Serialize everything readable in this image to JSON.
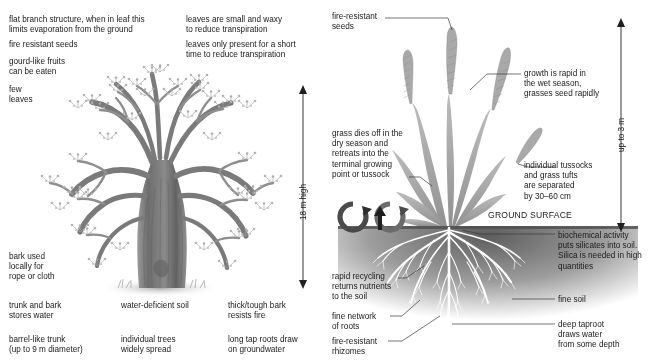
{
  "diagram": {
    "ground_surface_label": "GROUND SURFACE"
  },
  "colors": {
    "ink": "#1a1a1a",
    "leader": "#3a3a3a",
    "tree_dark": "#6f6f6f",
    "tree_mid": "#8d8d8d",
    "tree_light": "#b4b4b4",
    "soil_dark": "#5a5a5a",
    "soil_light": "#d8d8d8",
    "root_white": "#ffffff",
    "arrow_dark": "#3d3d3d"
  },
  "left_panel": {
    "name": "baobab-tree-panel",
    "labels": [
      {
        "id": "flat-branch-structure",
        "text": "flat branch structure, when in leaf this\nlimits evaporation from the ground",
        "x": 9,
        "y": 15
      },
      {
        "id": "fire-resistant-seeds-tree",
        "text": "fire resistant seeds",
        "x": 9,
        "y": 40
      },
      {
        "id": "gourd-like-fruits",
        "text": "gourd-like fruits\ncan be eaten",
        "x": 9,
        "y": 57
      },
      {
        "id": "few-leaves",
        "text": "few\nleaves",
        "x": 9,
        "y": 85
      },
      {
        "id": "leaves-small-waxy",
        "text": "leaves are small and waxy\nto reduce transpiration",
        "x": 186,
        "y": 15
      },
      {
        "id": "leaves-short-time",
        "text": "leaves only present for a short\ntime to reduce transpiration",
        "x": 186,
        "y": 40
      },
      {
        "id": "bark-used-locally",
        "text": "bark used\nlocally for\nrope or cloth",
        "x": 9,
        "y": 252
      },
      {
        "id": "trunk-bark-stores-water",
        "text": "trunk and bark\nstores water",
        "x": 9,
        "y": 301
      },
      {
        "id": "water-deficient-soil",
        "text": "water-deficient soil",
        "x": 121,
        "y": 301
      },
      {
        "id": "thick-tough-bark",
        "text": "thick/tough bark\nresists fire",
        "x": 228,
        "y": 301
      },
      {
        "id": "barrel-like-trunk",
        "text": "barrel-like trunk\n(up to 9 m diameter)",
        "x": 9,
        "y": 335
      },
      {
        "id": "individual-trees-spread",
        "text": "individual trees\nwidely spread",
        "x": 121,
        "y": 335
      },
      {
        "id": "long-tap-roots",
        "text": "long tap roots draw\non groundwater",
        "x": 228,
        "y": 335
      }
    ],
    "height_measure": {
      "id": "tree-height-measure",
      "text": "18 m high",
      "value": 18,
      "unit": "m",
      "x": 299,
      "y_top": 86,
      "y_bottom": 288
    }
  },
  "right_panel": {
    "name": "tussock-grass-panel",
    "labels": [
      {
        "id": "fire-resistant-seeds-grass",
        "text": "fire-resistant\nseeds",
        "x": 332,
        "y": 12
      },
      {
        "id": "growth-rapid-wet-season",
        "text": "growth is rapid in\nthe wet season,\ngrasses seed rapidly",
        "x": 524,
        "y": 69
      },
      {
        "id": "grass-dies-off-dry-season",
        "text": "grass dies off in the\ndry season and\nretreats into the\nterminal growing\npoint or tussock",
        "x": 332,
        "y": 129
      },
      {
        "id": "individual-tussocks",
        "text": "individual tussocks\nand grass tufts\nare separated\nby 30–60 cm",
        "x": 524,
        "y": 161
      },
      {
        "id": "ground-surface",
        "text": "GROUND SURFACE",
        "x": 488,
        "y": 210
      },
      {
        "id": "biochemical-activity",
        "text": "biochemical activity\nputs silicates into soil.\nSilica is needed in high\nquantities",
        "x": 558,
        "y": 231
      },
      {
        "id": "rapid-recycling",
        "text": "rapid recycling\nreturns nutrients\nto the soil",
        "x": 332,
        "y": 272
      },
      {
        "id": "fine-network-of-roots",
        "text": "fine network\nof roots",
        "x": 332,
        "y": 312
      },
      {
        "id": "fine-soil",
        "text": "fine soil",
        "x": 558,
        "y": 295
      },
      {
        "id": "deep-taproot",
        "text": "deep taproot\ndraws water\nfrom some depth",
        "x": 558,
        "y": 320
      },
      {
        "id": "fire-resistant-rhizomes",
        "text": "fire-resistant\nrhizomes",
        "x": 332,
        "y": 337
      }
    ],
    "height_measure": {
      "id": "grass-height-measure",
      "text": "up to 3 m",
      "value": 3,
      "unit": "m",
      "x": 617,
      "y_top": 18,
      "y_bottom": 231
    }
  }
}
